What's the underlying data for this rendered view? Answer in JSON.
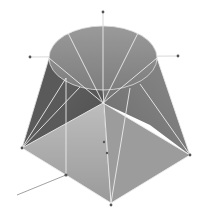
{
  "figure": {
    "background": "#ffffff",
    "colors": {
      "top_face": "#8a8a8a",
      "left_face": "#5e5e5e",
      "front_face": "#a9a9a9",
      "right_face": "#777777",
      "edges": "#e8e8e8",
      "axis": "#9a9a9a",
      "points": "#555555"
    },
    "top_ellipse": {
      "cx": 103,
      "cy": 58,
      "rx": 54,
      "ry": 32
    },
    "base": {
      "left": [
        22,
        148
      ],
      "front": [
        111,
        203
      ],
      "right": [
        190,
        155
      ],
      "front_left": [
        66,
        175
      ]
    },
    "axis_points": [
      [
        103,
        12
      ],
      [
        30,
        57
      ],
      [
        178,
        56
      ],
      [
        22,
        148
      ],
      [
        190,
        155
      ],
      [
        111,
        205
      ],
      [
        66,
        175
      ]
    ],
    "external_line": {
      "from": [
        66,
        175
      ],
      "to": [
        17,
        195
      ]
    }
  }
}
